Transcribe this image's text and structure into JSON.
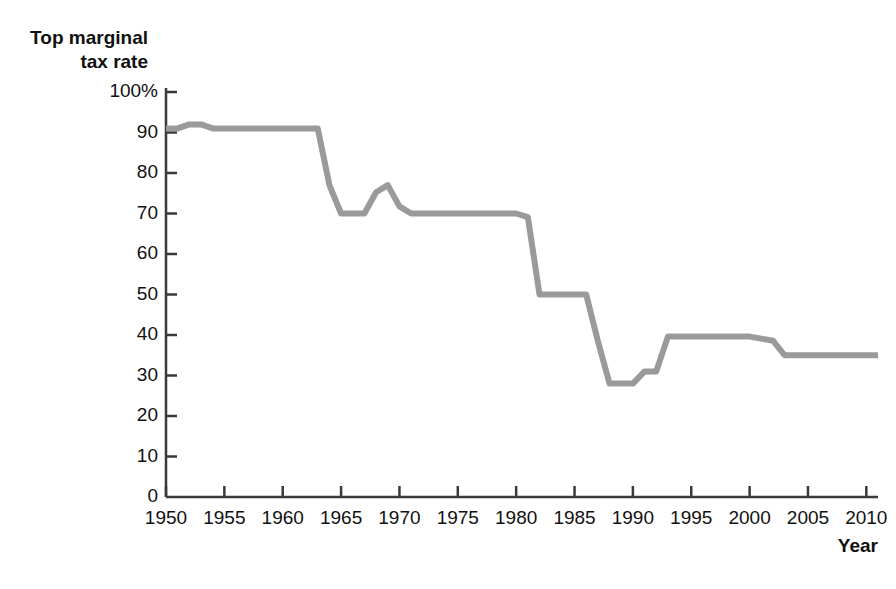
{
  "chart_data": {
    "type": "line",
    "title": "",
    "ylabel": "Top marginal\ntax rate",
    "ylabel_line1": "Top marginal",
    "ylabel_line2": "tax rate",
    "xlabel": "Year",
    "xlim": [
      1950,
      2011
    ],
    "ylim": [
      0,
      100
    ],
    "grid": false,
    "legend": null,
    "series_color": "#9a9a9a",
    "axis_color": "#3a3a3a",
    "y_ticks": [
      0,
      10,
      20,
      30,
      40,
      50,
      60,
      70,
      80,
      90,
      100
    ],
    "y_tick_labels": [
      "0",
      "10",
      "20",
      "30",
      "40",
      "50",
      "60",
      "70",
      "80",
      "90",
      "100%"
    ],
    "x_ticks": [
      1950,
      1955,
      1960,
      1965,
      1970,
      1975,
      1980,
      1985,
      1990,
      1995,
      2000,
      2005,
      2010
    ],
    "x_tick_labels": [
      "1950",
      "1955",
      "1960",
      "1965",
      "1970",
      "1975",
      "1980",
      "1985",
      "1990",
      "1995",
      "2000",
      "2005",
      "2010"
    ],
    "series": [
      {
        "name": "Top marginal tax rate",
        "x": [
          1950,
          1951,
          1952,
          1953,
          1954,
          1955,
          1960,
          1962,
          1963,
          1964,
          1965,
          1966,
          1967,
          1968,
          1969,
          1970,
          1971,
          1975,
          1980,
          1981,
          1982,
          1983,
          1986,
          1987,
          1988,
          1990,
          1991,
          1992,
          1993,
          2000,
          2001,
          2002,
          2003,
          2011
        ],
        "values": [
          91,
          91,
          92,
          92,
          91,
          91,
          91,
          91,
          91,
          77,
          70,
          70,
          70,
          75.25,
          77,
          71.75,
          70,
          70,
          70,
          69.125,
          50,
          50,
          50,
          38.5,
          28,
          28,
          31,
          31,
          39.6,
          39.6,
          39.1,
          38.6,
          35,
          35
        ]
      }
    ]
  }
}
